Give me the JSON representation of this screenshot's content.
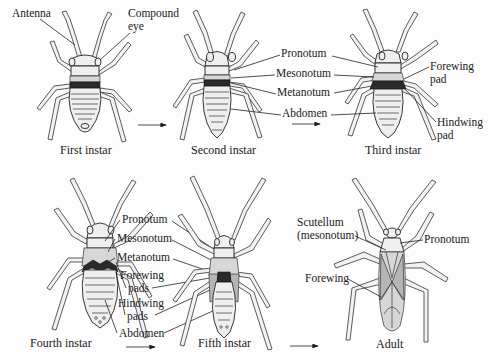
{
  "figure": {
    "stages": [
      {
        "id": "first",
        "caption": "First instar"
      },
      {
        "id": "second",
        "caption": "Second instar"
      },
      {
        "id": "third",
        "caption": "Third instar"
      },
      {
        "id": "fourth",
        "caption": "Fourth instar"
      },
      {
        "id": "fifth",
        "caption": "Fifth instar"
      },
      {
        "id": "adult",
        "caption": "Adult"
      }
    ],
    "labels": {
      "first": {
        "antenna": "Antenna",
        "compound_eye_1": "Compound",
        "compound_eye_2": "eye"
      },
      "second": {
        "pronotum": "Pronotum",
        "mesonotum": "Mesonotum",
        "metanotum": "Metanotum",
        "abdomen": "Abdomen"
      },
      "third": {
        "forewing_pad_1": "Forewing",
        "forewing_pad_2": "pad",
        "hindwing_pad_1": "Hindwing",
        "hindwing_pad_2": "pad"
      },
      "fourth_fifth": {
        "pronotum": "Pronotum",
        "mesonotum": "Mesonotum",
        "metanotum": "Metanotum",
        "forewing_pads_1": "Forewing",
        "forewing_pads_2": "pads",
        "hindwing_pads_1": "Hindwing",
        "hindwing_pads_2": "pads",
        "abdomen": "Abdomen"
      },
      "adult": {
        "scutellum_1": "Scutellum",
        "scutellum_2": "(mesonotum)",
        "pronotum": "Pronotum",
        "forewing": "Forewing"
      }
    },
    "arrows": [
      {
        "from": "first",
        "to": "second"
      },
      {
        "from": "second",
        "to": "third"
      },
      {
        "from": "fourth",
        "to": "fifth"
      },
      {
        "from": "fifth",
        "to": "adult"
      }
    ]
  }
}
